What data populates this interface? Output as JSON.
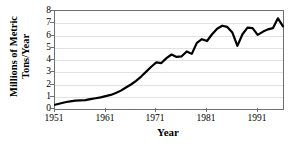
{
  "chart_data": {
    "type": "line",
    "title": "",
    "xlabel": "Year",
    "ylabel": "Millions of Metric Tons/Year",
    "ylabel_lines": [
      "Millions of Metric",
      "Tons/Year"
    ],
    "xlim": [
      1951,
      1996
    ],
    "ylim": [
      0,
      8
    ],
    "yticks": [
      0,
      1,
      2,
      3,
      4,
      5,
      6,
      7,
      8
    ],
    "ytick_labels": [
      "0",
      "1",
      "2",
      "3",
      "4",
      "5",
      "6",
      "7",
      "8"
    ],
    "xticks": [
      1951,
      1961,
      1971,
      1981,
      1991
    ],
    "xtick_labels": [
      "1951",
      "1961",
      "1971",
      "1981",
      "1991"
    ],
    "grid": "horizontal",
    "legend": null,
    "line_color": "#000000",
    "line_width": 2.2,
    "grid_color": "#e2e2e2",
    "axis_color": "#6f6f6f",
    "x": [
      1951,
      1952,
      1953,
      1954,
      1955,
      1956,
      1957,
      1958,
      1959,
      1960,
      1961,
      1962,
      1963,
      1964,
      1965,
      1966,
      1967,
      1968,
      1969,
      1970,
      1971,
      1972,
      1973,
      1974,
      1975,
      1976,
      1977,
      1978,
      1979,
      1980,
      1981,
      1982,
      1983,
      1984,
      1985,
      1986,
      1987,
      1988,
      1989,
      1990,
      1991,
      1992,
      1993,
      1994,
      1995,
      1996
    ],
    "values": [
      0.35,
      0.45,
      0.55,
      0.62,
      0.68,
      0.7,
      0.72,
      0.8,
      0.88,
      0.95,
      1.05,
      1.15,
      1.3,
      1.5,
      1.75,
      2.0,
      2.3,
      2.65,
      3.05,
      3.45,
      3.8,
      3.75,
      4.15,
      4.45,
      4.25,
      4.3,
      4.7,
      4.5,
      5.4,
      5.7,
      5.55,
      6.1,
      6.55,
      6.8,
      6.7,
      6.25,
      5.15,
      6.1,
      6.65,
      6.6,
      6.05,
      6.3,
      6.5,
      6.6,
      7.4,
      6.75
    ],
    "series_name": "Production"
  },
  "axes": {
    "x_title": "Year",
    "y_title_line1": "Millions of Metric",
    "y_title_line2": "Tons/Year"
  }
}
